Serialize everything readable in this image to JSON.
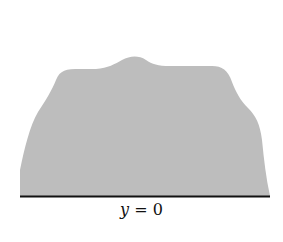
{
  "diagram": {
    "region_fill": "#bdbdbd",
    "baseline_color": "#111111",
    "baseline_label_var": "y",
    "baseline_label_rest": " = 0"
  }
}
